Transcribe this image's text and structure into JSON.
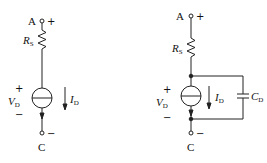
{
  "diagrams": [
    {
      "id": "left",
      "terminal_top": {
        "label": "A",
        "sign": "+"
      },
      "terminal_bottom": {
        "label": "C",
        "sign": "−"
      },
      "resistor": {
        "label": "R",
        "sub": "S"
      },
      "voltage": {
        "label": "V",
        "sub": "D",
        "plus": "+",
        "minus": "−"
      },
      "current": {
        "label": "I",
        "sub": "D"
      }
    },
    {
      "id": "right",
      "terminal_top": {
        "label": "A",
        "sign": "+"
      },
      "terminal_bottom": {
        "label": "C",
        "sign": "−"
      },
      "resistor": {
        "label": "R",
        "sub": "S"
      },
      "voltage": {
        "label": "V",
        "sub": "D",
        "plus": "+",
        "minus": "−"
      },
      "current": {
        "label": "I",
        "sub": "D"
      },
      "capacitor": {
        "label": "C",
        "sub": "D"
      }
    }
  ],
  "colors": {
    "line": "#222222",
    "background": "#ffffff"
  }
}
